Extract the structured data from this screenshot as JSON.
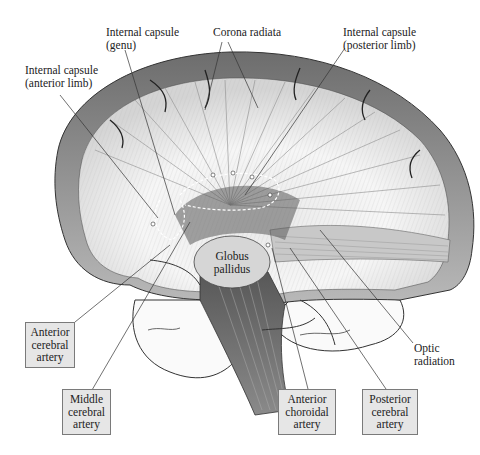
{
  "figure": {
    "type": "anatomical-illustration"
  },
  "labels": {
    "ic_genu": [
      "Internal capsule",
      "(genu)"
    ],
    "corona_radiata": [
      "Corona radiata"
    ],
    "ic_posterior": [
      "Internal capsule",
      "(posterior limb)"
    ],
    "ic_anterior": [
      "Internal capsule",
      "(anterior limb)"
    ],
    "globus_pallidus": [
      "Globus",
      "pallidus"
    ],
    "optic_radiation": [
      "Optic",
      "radiation"
    ]
  },
  "boxes": {
    "anterior_cerebral": [
      "Anterior",
      "cerebral",
      "artery"
    ],
    "middle_cerebral": [
      "Middle",
      "cerebral",
      "artery"
    ],
    "anterior_choroidal": [
      "Anterior",
      "choroidal",
      "artery"
    ],
    "posterior_cerebral": [
      "Posterior",
      "cerebral",
      "artery"
    ]
  },
  "colors": {
    "background": "#ffffff",
    "box_fill": "#e6e6e6",
    "box_border": "#7a7a7a",
    "ink": "#222222"
  }
}
